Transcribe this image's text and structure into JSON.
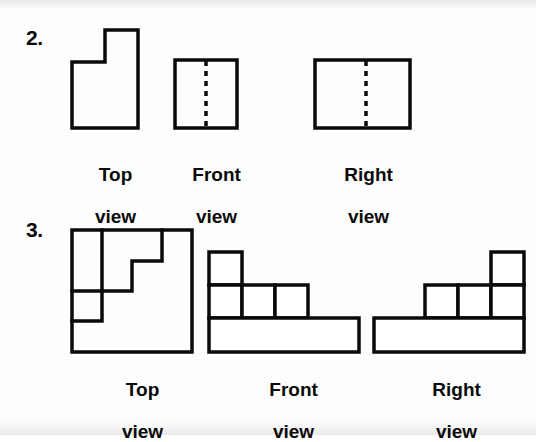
{
  "page": {
    "background_color": "#fdfdfd",
    "line_color": "#0a0a0a",
    "fill_color": "#ffffff"
  },
  "problems": [
    {
      "number": "2.",
      "views": [
        {
          "name": "top",
          "label_line1": "Top",
          "label_line2": "view"
        },
        {
          "name": "front",
          "label_line1": "Front",
          "label_line2": "view"
        },
        {
          "name": "right",
          "label_line1": "Right",
          "label_line2": "view"
        }
      ]
    },
    {
      "number": "3.",
      "views": [
        {
          "name": "top",
          "label_line1": "Top",
          "label_line2": "view"
        },
        {
          "name": "front",
          "label_line1": "Front",
          "label_line2": "view"
        },
        {
          "name": "right",
          "label_line1": "Right",
          "label_line2": "view"
        }
      ]
    }
  ],
  "figures": {
    "p2_top": {
      "description": "notched L-shaped outline, notch removed from upper-left",
      "stroke_width": 3.5,
      "viewbox": "0 0 70 102",
      "outline": "M 2,34 L 35,34 L 35,2 L 68,2 L 68,100 L 2,100 Z"
    },
    "p2_front": {
      "description": "square with vertical hidden (dashed) centerline",
      "stroke_width": 3.5,
      "viewbox": "0 0 66 72",
      "outline": "M 2,2 L 64,2 L 64,70 L 2,70 Z",
      "hidden_line": "M 33,3 L 33,69",
      "dash_pattern": "5 5",
      "hidden_stroke_width": 3.5
    },
    "p2_right": {
      "description": "wide rectangle with vertical hidden (dashed) line left of center",
      "stroke_width": 3.5,
      "viewbox": "0 0 99 72",
      "outline": "M 2,2 L 97,2 L 97,70 L 2,70 Z",
      "hidden_line": "M 53,3 L 53,69",
      "dash_pattern": "5 5",
      "hidden_stroke_width": 3.5
    },
    "p3_top": {
      "description": "square outline containing an internal descending staircase polyline on a 4x4 grid",
      "stroke_width": 3.5,
      "viewbox": "0 0 124 126",
      "outline": "M 2,2 L 122,2 L 122,124 L 2,124 Z",
      "interior_lines": [
        "M 2,63 L 32,63 L 32,2",
        "M 2,93 L 32,93 L 32,63 L 62,63 L 62,33 L 92,33 L 92,2"
      ]
    },
    "p3_front": {
      "description": "stepped solid: one unit square top-left, three unit squares middle row, wide base bar",
      "stroke_width": 3.5,
      "viewbox": "0 0 154 104",
      "cells": [
        {
          "x": 2,
          "y": 2,
          "w": 33,
          "h": 33
        },
        {
          "x": 2,
          "y": 35,
          "w": 33,
          "h": 33
        },
        {
          "x": 35,
          "y": 35,
          "w": 33,
          "h": 33
        },
        {
          "x": 68,
          "y": 35,
          "w": 33,
          "h": 33
        },
        {
          "x": 2,
          "y": 68,
          "w": 150,
          "h": 34
        }
      ]
    },
    "p3_right": {
      "description": "mirrored stepped solid: wide base bar, three unit squares middle row, one unit square top-right",
      "stroke_width": 3.5,
      "viewbox": "0 0 154 104",
      "cells": [
        {
          "x": 119,
          "y": 2,
          "w": 33,
          "h": 33
        },
        {
          "x": 53,
          "y": 35,
          "w": 33,
          "h": 33
        },
        {
          "x": 86,
          "y": 35,
          "w": 33,
          "h": 33
        },
        {
          "x": 119,
          "y": 35,
          "w": 33,
          "h": 33
        },
        {
          "x": 2,
          "y": 68,
          "w": 150,
          "h": 34
        }
      ]
    }
  }
}
